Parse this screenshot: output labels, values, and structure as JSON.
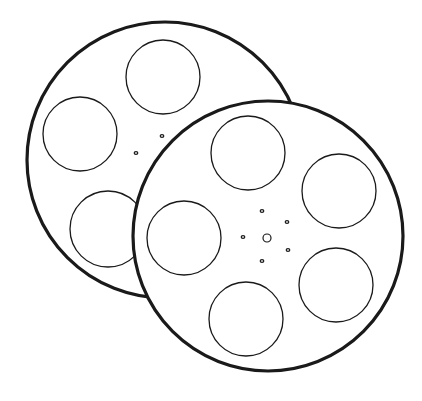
{
  "image": {
    "subject": "Two overlapping film reels line drawing",
    "background": "#ffffff",
    "stroke_color": "#1a1a1a"
  },
  "reels": [
    {
      "name": "back-reel",
      "cx": 165,
      "cy": 160,
      "r": 138,
      "holes": [
        {
          "cx": 163,
          "cy": 77,
          "r": 37
        },
        {
          "cx": 80,
          "cy": 134,
          "r": 37
        },
        {
          "cx": 108,
          "cy": 229,
          "r": 38
        }
      ],
      "dots": [
        {
          "cx": 162,
          "cy": 136
        },
        {
          "cx": 136,
          "cy": 153
        }
      ]
    },
    {
      "name": "front-reel",
      "cx": 268,
      "cy": 236,
      "r": 135,
      "holes": [
        {
          "cx": 248,
          "cy": 153,
          "r": 37
        },
        {
          "cx": 339,
          "cy": 191,
          "r": 37
        },
        {
          "cx": 184,
          "cy": 238,
          "r": 37
        },
        {
          "cx": 336,
          "cy": 285,
          "r": 37
        },
        {
          "cx": 246,
          "cy": 319,
          "r": 37
        }
      ],
      "hub": {
        "cx": 267,
        "cy": 238,
        "r": 4
      },
      "dots": [
        {
          "cx": 262,
          "cy": 211
        },
        {
          "cx": 287,
          "cy": 222
        },
        {
          "cx": 243,
          "cy": 237
        },
        {
          "cx": 288,
          "cy": 250
        },
        {
          "cx": 262,
          "cy": 261
        }
      ]
    }
  ]
}
